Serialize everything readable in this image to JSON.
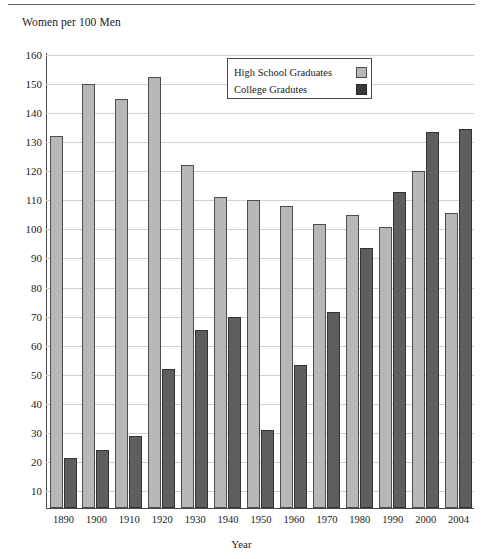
{
  "header": {
    "rule": "horizontal-rule"
  },
  "chart_data": {
    "type": "bar",
    "title": "",
    "ylabel": "Women per 100 Men",
    "xlabel": "Year",
    "categories": [
      "1890",
      "1900",
      "1910",
      "1920",
      "1930",
      "1940",
      "1950",
      "1960",
      "1970",
      "1980",
      "1990",
      "2000",
      "2004"
    ],
    "series": [
      {
        "name": "High School Graduates",
        "color": "#b7b7b7",
        "values": [
          132,
          150,
          145,
          152.5,
          122,
          111,
          110,
          108,
          102,
          105,
          101,
          120,
          105.5
        ]
      },
      {
        "name": "College Gradutes",
        "color": "#3a3a3a",
        "values": [
          21.5,
          24,
          29,
          52,
          65.5,
          70,
          31,
          53.5,
          71.5,
          93.5,
          113,
          133.5,
          134.5
        ]
      }
    ],
    "ylim": [
      0,
      160
    ],
    "yticks": [
      10,
      20,
      30,
      40,
      50,
      60,
      70,
      80,
      90,
      100,
      110,
      120,
      130,
      140,
      150,
      160
    ],
    "grid": true,
    "legend_position": "top-center"
  },
  "legend": {
    "entries": [
      {
        "label": "High School Graduates",
        "swatch": "light-gray-square"
      },
      {
        "label": "College Gradutes",
        "swatch": "dark-gray-square"
      }
    ]
  }
}
